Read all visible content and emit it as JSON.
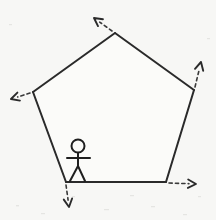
{
  "figure": {
    "title": "Regular pentagon with exterior-angle rays and stick figure",
    "background_color": "#f7f7f5",
    "ink_color": "#2a2a2a",
    "canvas": {
      "width": 216,
      "height": 220
    }
  },
  "chart_data": {
    "type": "diagram",
    "xlabel": "",
    "ylabel": "",
    "shape": {
      "name": "pentagon",
      "sides": 5,
      "closed": true,
      "vertices": [
        {
          "id": "top",
          "x": 115,
          "y": 33
        },
        {
          "id": "upper-right",
          "x": 194,
          "y": 90
        },
        {
          "id": "lower-right",
          "x": 166,
          "y": 182
        },
        {
          "id": "lower-left",
          "x": 66,
          "y": 182
        },
        {
          "id": "upper-left",
          "x": 33,
          "y": 92
        }
      ],
      "edges": [
        {
          "from": "upper-left",
          "to": "top"
        },
        {
          "from": "top",
          "to": "upper-right"
        },
        {
          "from": "upper-right",
          "to": "lower-right"
        },
        {
          "from": "lower-right",
          "to": "lower-left"
        },
        {
          "from": "lower-left",
          "to": "upper-left"
        }
      ]
    },
    "rays": [
      {
        "id": "ray-top",
        "from_vertex": "top",
        "x1": 112,
        "y1": 31,
        "x2": 94,
        "y2": 18,
        "direction": "up-left",
        "style": "dashed",
        "arrowhead": true
      },
      {
        "id": "ray-upper-right",
        "from_vertex": "upper-right",
        "x1": 195,
        "y1": 87,
        "x2": 201,
        "y2": 62,
        "direction": "up-right",
        "style": "dashed",
        "arrowhead": true
      },
      {
        "id": "ray-lower-right",
        "from_vertex": "lower-right",
        "x1": 169,
        "y1": 183,
        "x2": 196,
        "y2": 184,
        "direction": "right",
        "style": "dashed",
        "arrowhead": true
      },
      {
        "id": "ray-lower-left",
        "from_vertex": "lower-left",
        "x1": 66,
        "y1": 185,
        "x2": 69,
        "y2": 207,
        "direction": "down",
        "style": "dashed",
        "arrowhead": true
      },
      {
        "id": "ray-upper-left",
        "from_vertex": "upper-left",
        "x1": 30,
        "y1": 93,
        "x2": 11,
        "y2": 99,
        "direction": "down-left",
        "style": "dashed",
        "arrowhead": true
      }
    ],
    "figures": [
      {
        "id": "stick-figure",
        "standing_on": "bottom-edge",
        "head": {
          "cx": 78,
          "cy": 146,
          "r": 6.5
        },
        "body": {
          "x1": 78,
          "y1": 153,
          "x2": 78,
          "y2": 166
        },
        "arms": {
          "x1": 67,
          "y1": 158,
          "x2": 90,
          "y2": 158
        },
        "legs": [
          {
            "x1": 78,
            "y1": 166,
            "x2": 70,
            "y2": 181
          },
          {
            "x1": 78,
            "y1": 166,
            "x2": 85,
            "y2": 181
          }
        ]
      }
    ],
    "annotations": [],
    "grid": false,
    "legend": null
  }
}
